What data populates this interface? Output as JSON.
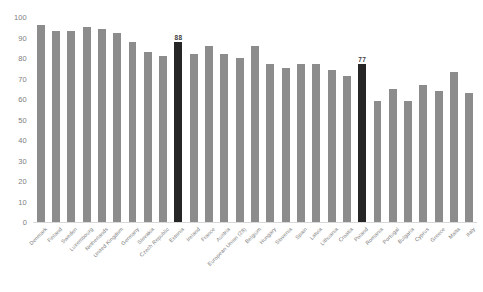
{
  "chart_data": {
    "type": "bar",
    "title": "",
    "subtitle": "",
    "xlabel": "",
    "ylabel": "",
    "ylim": [
      0,
      100
    ],
    "yticks": [
      0,
      10,
      20,
      30,
      40,
      50,
      60,
      70,
      80,
      90,
      100
    ],
    "grid": false,
    "legend": "none",
    "bar_color": "#8c8c8c",
    "highlight_color": "#262626",
    "highlighted_categories": [
      "Estonia",
      "Poland"
    ],
    "value_labels_shown": [
      "88",
      "77"
    ],
    "categories": [
      "Denmark",
      "Finland",
      "Sweden",
      "Luxembourg",
      "Netherlands",
      "United Kingdom",
      "Germany",
      "Slovakia",
      "Czech Republic",
      "Estonia",
      "Ireland",
      "France",
      "Austria",
      "European Union (28)",
      "Belgium",
      "Hungary",
      "Slovenia",
      "Spain",
      "Latvia",
      "Lithuania",
      "Croatia",
      "Poland",
      "Romania",
      "Portugal",
      "Bulgaria",
      "Cyprus",
      "Greece",
      "Malta",
      "Italy"
    ],
    "values": [
      96,
      93,
      93,
      95,
      94,
      92,
      88,
      83,
      81,
      88,
      82,
      86,
      82,
      80,
      86,
      77,
      75,
      77,
      77,
      74,
      71,
      77,
      59,
      65,
      59,
      67,
      64,
      73,
      63
    ]
  }
}
